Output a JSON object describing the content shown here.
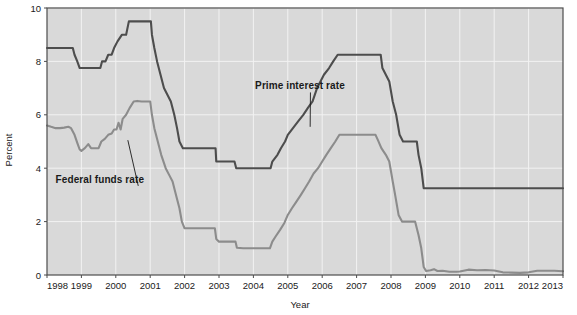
{
  "chart_data": {
    "type": "line",
    "title": "",
    "xlabel": "Year",
    "ylabel": "Percent",
    "xlim": [
      1998,
      2013
    ],
    "ylim": [
      0,
      10
    ],
    "ytick_values": [
      0,
      2,
      4,
      6,
      8,
      10
    ],
    "ytick_labels": [
      "0",
      "2",
      "4",
      "6",
      "8",
      "10"
    ],
    "xtick_values": [
      1998,
      1999,
      2000,
      2001,
      2002,
      2003,
      2004,
      2005,
      2006,
      2007,
      2008,
      2009,
      2010,
      2011,
      2012,
      2013
    ],
    "xtick_labels": [
      "1998",
      "1999",
      "2000",
      "2001",
      "2002",
      "2003",
      "2004",
      "2005",
      "2006",
      "2007",
      "2008",
      "2009",
      "2010",
      "2011",
      "2012",
      "2013"
    ],
    "grid": true,
    "legend_position": "inline-annotations",
    "plot_background": "#d9d9d9",
    "grid_color": "#f2f2f2",
    "series": [
      {
        "name": "Prime interest rate",
        "color": "#4d4d4d",
        "annotation": {
          "label": "Prime interest rate",
          "text_x": 2004.05,
          "text_y": 6.95,
          "leader_to_x": 2005.65,
          "leader_to_y": 5.55
        },
        "points": [
          [
            1998.0,
            8.5
          ],
          [
            1998.4,
            8.5
          ],
          [
            1998.75,
            8.5
          ],
          [
            1998.8,
            8.25
          ],
          [
            1998.88,
            8.0
          ],
          [
            1998.95,
            7.75
          ],
          [
            1999.0,
            7.75
          ],
          [
            1999.3,
            7.75
          ],
          [
            1999.55,
            7.75
          ],
          [
            1999.6,
            8.0
          ],
          [
            1999.7,
            8.0
          ],
          [
            1999.78,
            8.25
          ],
          [
            1999.88,
            8.25
          ],
          [
            1999.95,
            8.5
          ],
          [
            2000.05,
            8.75
          ],
          [
            2000.18,
            9.0
          ],
          [
            2000.3,
            9.0
          ],
          [
            2000.38,
            9.5
          ],
          [
            2000.55,
            9.5
          ],
          [
            2000.72,
            9.5
          ],
          [
            2000.95,
            9.5
          ],
          [
            2001.02,
            9.5
          ],
          [
            2001.05,
            9.0
          ],
          [
            2001.12,
            8.5
          ],
          [
            2001.2,
            8.0
          ],
          [
            2001.3,
            7.5
          ],
          [
            2001.4,
            7.0
          ],
          [
            2001.5,
            6.75
          ],
          [
            2001.6,
            6.5
          ],
          [
            2001.7,
            6.0
          ],
          [
            2001.78,
            5.5
          ],
          [
            2001.85,
            5.0
          ],
          [
            2001.95,
            4.75
          ],
          [
            2002.0,
            4.75
          ],
          [
            2002.5,
            4.75
          ],
          [
            2002.9,
            4.75
          ],
          [
            2002.92,
            4.25
          ],
          [
            2003.0,
            4.25
          ],
          [
            2003.3,
            4.25
          ],
          [
            2003.45,
            4.25
          ],
          [
            2003.5,
            4.0
          ],
          [
            2003.6,
            4.0
          ],
          [
            2004.0,
            4.0
          ],
          [
            2004.4,
            4.0
          ],
          [
            2004.5,
            4.0
          ],
          [
            2004.55,
            4.25
          ],
          [
            2004.7,
            4.5
          ],
          [
            2004.8,
            4.75
          ],
          [
            2004.92,
            5.0
          ],
          [
            2005.0,
            5.25
          ],
          [
            2005.15,
            5.5
          ],
          [
            2005.3,
            5.75
          ],
          [
            2005.45,
            6.0
          ],
          [
            2005.58,
            6.25
          ],
          [
            2005.72,
            6.5
          ],
          [
            2005.85,
            7.0
          ],
          [
            2005.95,
            7.25
          ],
          [
            2006.05,
            7.5
          ],
          [
            2006.2,
            7.75
          ],
          [
            2006.32,
            8.0
          ],
          [
            2006.45,
            8.25
          ],
          [
            2006.55,
            8.25
          ],
          [
            2007.0,
            8.25
          ],
          [
            2007.45,
            8.25
          ],
          [
            2007.7,
            8.25
          ],
          [
            2007.75,
            7.75
          ],
          [
            2007.85,
            7.5
          ],
          [
            2007.95,
            7.25
          ],
          [
            2008.05,
            6.5
          ],
          [
            2008.15,
            6.0
          ],
          [
            2008.25,
            5.25
          ],
          [
            2008.35,
            5.0
          ],
          [
            2008.55,
            5.0
          ],
          [
            2008.75,
            5.0
          ],
          [
            2008.8,
            4.5
          ],
          [
            2008.88,
            4.0
          ],
          [
            2008.95,
            3.25
          ],
          [
            2009.0,
            3.25
          ],
          [
            2010.0,
            3.25
          ],
          [
            2011.0,
            3.25
          ],
          [
            2012.0,
            3.25
          ],
          [
            2013.0,
            3.25
          ]
        ]
      },
      {
        "name": "Federal funds rate",
        "color": "#8c8c8c",
        "annotation": {
          "label": "Federal funds rate",
          "text_x": 1998.25,
          "text_y": 3.45,
          "leader_to_x": 2000.35,
          "leader_to_y": 5.05
        },
        "points": [
          [
            1998.0,
            5.6
          ],
          [
            1998.12,
            5.55
          ],
          [
            1998.25,
            5.5
          ],
          [
            1998.38,
            5.5
          ],
          [
            1998.5,
            5.52
          ],
          [
            1998.62,
            5.55
          ],
          [
            1998.7,
            5.5
          ],
          [
            1998.8,
            5.25
          ],
          [
            1998.88,
            4.95
          ],
          [
            1998.95,
            4.7
          ],
          [
            1999.0,
            4.65
          ],
          [
            1999.1,
            4.75
          ],
          [
            1999.2,
            4.9
          ],
          [
            1999.28,
            4.75
          ],
          [
            1999.38,
            4.75
          ],
          [
            1999.5,
            4.75
          ],
          [
            1999.58,
            5.0
          ],
          [
            1999.68,
            5.1
          ],
          [
            1999.78,
            5.25
          ],
          [
            1999.88,
            5.3
          ],
          [
            1999.95,
            5.45
          ],
          [
            2000.02,
            5.45
          ],
          [
            2000.08,
            5.7
          ],
          [
            2000.14,
            5.45
          ],
          [
            2000.2,
            5.85
          ],
          [
            2000.3,
            6.0
          ],
          [
            2000.4,
            6.25
          ],
          [
            2000.52,
            6.5
          ],
          [
            2000.62,
            6.52
          ],
          [
            2000.75,
            6.5
          ],
          [
            2000.9,
            6.5
          ],
          [
            2001.0,
            6.5
          ],
          [
            2001.05,
            6.0
          ],
          [
            2001.12,
            5.5
          ],
          [
            2001.22,
            5.0
          ],
          [
            2001.32,
            4.5
          ],
          [
            2001.45,
            4.0
          ],
          [
            2001.55,
            3.75
          ],
          [
            2001.65,
            3.5
          ],
          [
            2001.75,
            3.0
          ],
          [
            2001.85,
            2.5
          ],
          [
            2001.92,
            2.0
          ],
          [
            2002.0,
            1.75
          ],
          [
            2002.3,
            1.75
          ],
          [
            2002.6,
            1.75
          ],
          [
            2002.88,
            1.75
          ],
          [
            2002.92,
            1.35
          ],
          [
            2003.0,
            1.25
          ],
          [
            2003.2,
            1.25
          ],
          [
            2003.4,
            1.25
          ],
          [
            2003.48,
            1.25
          ],
          [
            2003.52,
            1.02
          ],
          [
            2003.7,
            1.0
          ],
          [
            2004.0,
            1.0
          ],
          [
            2004.3,
            1.0
          ],
          [
            2004.48,
            1.0
          ],
          [
            2004.55,
            1.25
          ],
          [
            2004.65,
            1.45
          ],
          [
            2004.78,
            1.7
          ],
          [
            2004.9,
            1.95
          ],
          [
            2005.0,
            2.25
          ],
          [
            2005.12,
            2.5
          ],
          [
            2005.25,
            2.75
          ],
          [
            2005.38,
            3.0
          ],
          [
            2005.5,
            3.25
          ],
          [
            2005.62,
            3.5
          ],
          [
            2005.75,
            3.8
          ],
          [
            2005.88,
            4.0
          ],
          [
            2006.0,
            4.25
          ],
          [
            2006.12,
            4.5
          ],
          [
            2006.25,
            4.75
          ],
          [
            2006.38,
            5.0
          ],
          [
            2006.5,
            5.25
          ],
          [
            2006.7,
            5.25
          ],
          [
            2007.0,
            5.25
          ],
          [
            2007.3,
            5.25
          ],
          [
            2007.55,
            5.25
          ],
          [
            2007.62,
            5.05
          ],
          [
            2007.72,
            4.75
          ],
          [
            2007.85,
            4.5
          ],
          [
            2007.95,
            4.25
          ],
          [
            2008.05,
            3.5
          ],
          [
            2008.12,
            3.0
          ],
          [
            2008.22,
            2.25
          ],
          [
            2008.32,
            2.0
          ],
          [
            2008.5,
            2.0
          ],
          [
            2008.7,
            2.0
          ],
          [
            2008.8,
            1.5
          ],
          [
            2008.88,
            1.0
          ],
          [
            2008.95,
            0.3
          ],
          [
            2009.02,
            0.15
          ],
          [
            2009.15,
            0.18
          ],
          [
            2009.25,
            0.22
          ],
          [
            2009.35,
            0.15
          ],
          [
            2009.5,
            0.16
          ],
          [
            2009.7,
            0.12
          ],
          [
            2009.9,
            0.12
          ],
          [
            2010.0,
            0.13
          ],
          [
            2010.25,
            0.2
          ],
          [
            2010.5,
            0.18
          ],
          [
            2010.75,
            0.19
          ],
          [
            2011.0,
            0.17
          ],
          [
            2011.25,
            0.1
          ],
          [
            2011.5,
            0.09
          ],
          [
            2011.75,
            0.08
          ],
          [
            2012.0,
            0.1
          ],
          [
            2012.25,
            0.16
          ],
          [
            2012.5,
            0.16
          ],
          [
            2012.75,
            0.16
          ],
          [
            2013.0,
            0.14
          ],
          [
            2013.0,
            0.14
          ]
        ]
      }
    ]
  }
}
